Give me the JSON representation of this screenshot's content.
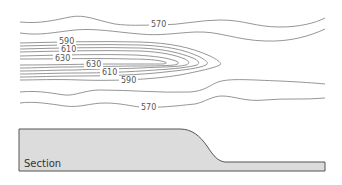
{
  "diagram": {
    "type": "topographic-contour-map-with-cross-section",
    "contour_labels": [
      {
        "id": "top-570",
        "text": "570",
        "x": 152,
        "y": 27
      },
      {
        "id": "left-590",
        "text": "590",
        "x": 60,
        "y": 44
      },
      {
        "id": "left-610",
        "text": "610",
        "x": 62,
        "y": 51
      },
      {
        "id": "left-630",
        "text": "630",
        "x": 57,
        "y": 60
      },
      {
        "id": "mid-630",
        "text": "630",
        "x": 88,
        "y": 67
      },
      {
        "id": "mid-610",
        "text": "610",
        "x": 104,
        "y": 75
      },
      {
        "id": "mid-590",
        "text": "590",
        "x": 124,
        "y": 83
      },
      {
        "id": "bottom-570",
        "text": "570",
        "x": 143,
        "y": 110
      }
    ],
    "contour_interval": 20,
    "contour_values": [
      570,
      590,
      610,
      630
    ],
    "colors": {
      "contour_line": "#8a8a8a",
      "section_fill": "#dcdcdc",
      "section_outline": "#555555",
      "label_text": "#555555"
    },
    "section": {
      "label": "Section"
    }
  }
}
